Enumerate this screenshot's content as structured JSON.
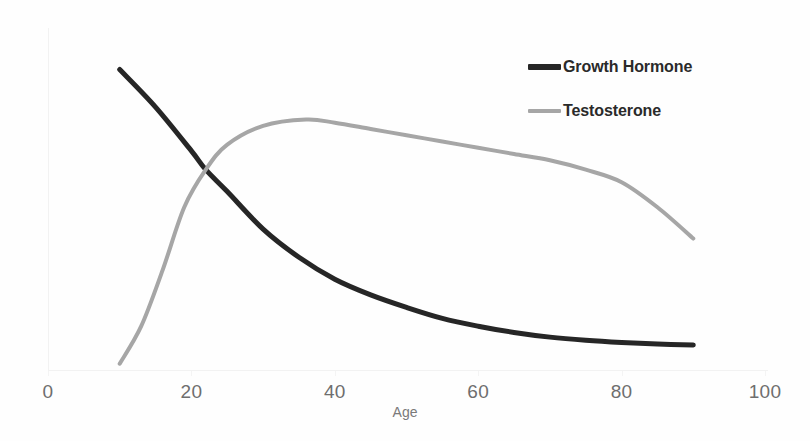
{
  "chart_data": {
    "type": "line",
    "title": "",
    "subtitle": "",
    "xlabel": "Age",
    "ylabel": "",
    "xlim": [
      0,
      100
    ],
    "ylim": [
      0,
      100
    ],
    "grid": false,
    "legend_position": "top-right",
    "xticks": [
      {
        "value": 0,
        "label": "0"
      },
      {
        "value": 20,
        "label": "20"
      },
      {
        "value": 40,
        "label": "40"
      },
      {
        "value": 60,
        "label": "60"
      },
      {
        "value": 80,
        "label": "80"
      },
      {
        "value": 100,
        "label": "100"
      }
    ],
    "yticks": [],
    "series": [
      {
        "name": "Growth Hormone",
        "color": "#262626",
        "stroke_width": 5,
        "x": [
          10,
          15,
          20,
          22,
          25,
          30,
          35,
          40,
          45,
          50,
          55,
          60,
          65,
          70,
          75,
          80,
          85,
          90
        ],
        "values": [
          96,
          84,
          70,
          64,
          57,
          45,
          36,
          29,
          24,
          20,
          16.5,
          14,
          12,
          10.5,
          9.5,
          8.8,
          8.3,
          8
        ]
      },
      {
        "name": "Testosterone",
        "color": "#a6a6a6",
        "stroke_width": 4,
        "x": [
          10,
          13,
          16,
          19,
          22,
          25,
          30,
          36,
          40,
          45,
          50,
          55,
          60,
          65,
          70,
          75,
          80,
          85,
          90
        ],
        "values": [
          2,
          14,
          32,
          52,
          64,
          72,
          78,
          80,
          79,
          77,
          75,
          73,
          71,
          69,
          67,
          64,
          60,
          52,
          42
        ]
      }
    ],
    "annotations": []
  },
  "legend": {
    "entries": [
      {
        "label": "Growth Hormone",
        "color": "#262626"
      },
      {
        "label": "Testosterone",
        "color": "#a6a6a6"
      }
    ]
  },
  "axis": {
    "x_title": "Age"
  },
  "colors": {
    "background": "#fefefe",
    "growth_hormone": "#262626",
    "testosterone": "#a6a6a6",
    "axis": "#f2f2f2",
    "tick_text": "#6e6e6e",
    "axis_title_text": "#7a7a7a"
  }
}
